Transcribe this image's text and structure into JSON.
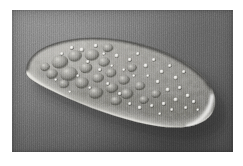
{
  "page": {
    "background_color": "#ffffff",
    "margin_left": 12,
    "margin_top": 10
  },
  "photo": {
    "caption": "",
    "modality": "differential-interference-contrast-light-micrograph",
    "subject": "ciliate-protozoan-paramecium",
    "background_color": "#6b6b6b",
    "highlight_color": "#f2f2ee",
    "shadow_color": "#2a2a2a",
    "width": 221,
    "height": 142,
    "x": 12,
    "y": 10
  },
  "specimen": {
    "name": "paramecium-cell",
    "shape": "elongated-ellipsoid",
    "orientation_degrees": -17,
    "anterior_end": "upper-left",
    "posterior_end": "lower-right",
    "center_x": 112,
    "center_y": 74,
    "length": 185,
    "width": 62,
    "cytoplasm_color": "#8a8a86",
    "rim_highlight_color": "#f4f3ee",
    "rim_shadow_color": "#242424",
    "organelles": "food-vacuoles-and-refractile-granules"
  },
  "features": {
    "vacuole_count": 22,
    "granule_count": 40,
    "bright_rim_edge": "lower-left",
    "dark_rim_edge": "upper-right",
    "cast_shadow_direction": "lower-right"
  },
  "chart_data": {
    "type": "table",
    "title": "",
    "categories": [],
    "values": []
  }
}
